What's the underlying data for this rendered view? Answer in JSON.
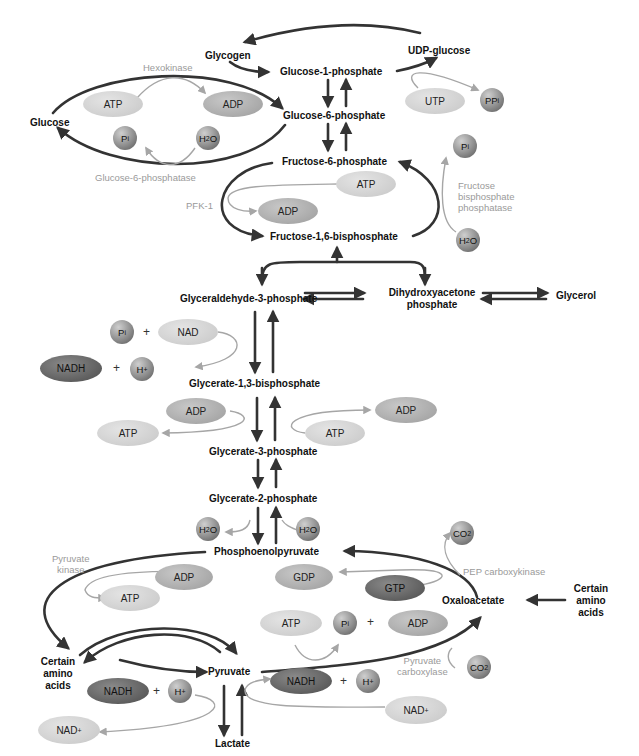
{
  "diagram": {
    "type": "metabolic-pathway",
    "title_fragment": "...p...g...",
    "colors": {
      "main_arrow": "#333333",
      "side_arrow": "#a6a6a6",
      "enzyme_text": "#9a9a9a",
      "node_text": "#111111"
    }
  },
  "nodes": {
    "glycogen": "Glycogen",
    "udp_glucose": "UDP-glucose",
    "glucose_1_phosphate": "Glucose-1-phosphate",
    "glucose": "Glucose",
    "glucose_6_phosphate": "Glucose-6-phosphate",
    "fructose_6_phosphate": "Fructose-6-phosphate",
    "fructose_1_6_bisphosphate": "Fructose-1,6-bisphosphate",
    "glyceraldehyde_3_phosphate": "Glyceraldehyde-3-phosphate",
    "dihydroxyacetone_phosphate_1": "Dihydroxyacetone",
    "dihydroxyacetone_phosphate_2": "phosphate",
    "glycerol": "Glycerol",
    "glycerate_1_3_bisphosphate": "Glycerate-1,3-bisphosphate",
    "glycerate_3_phosphate": "Glycerate-3-phosphate",
    "glycerate_2_phosphate": "Glycerate-2-phosphate",
    "phosphoenolpyruvate": "Phosphoenolpyruvate",
    "oxaloacetate": "Oxaloacetate",
    "amino_acids_right_1": "Certain",
    "amino_acids_right_2": "amino",
    "amino_acids_right_3": "acids",
    "amino_acids_left_1": "Certain",
    "amino_acids_left_2": "amino",
    "amino_acids_left_3": "acids",
    "pyruvate": "Pyruvate",
    "lactate": "Lactate"
  },
  "enzymes": {
    "hexokinase": "Hexokinase",
    "glucose_6_phosphatase": "Glucose-6-phosphatase",
    "pfk1": "PFK-1",
    "fbpase_1": "Fructose",
    "fbpase_2": "bisphosphate",
    "fbpase_3": "phosphatase",
    "pyruvate_kinase_1": "Pyruvate",
    "pyruvate_kinase_2": "kinase",
    "pep_carboxykinase": "PEP carboxykinase",
    "pyruvate_carboxylase_1": "Pyruvate",
    "pyruvate_carboxylase_2": "carboxylase"
  },
  "cofactors": {
    "atp": "ATP",
    "adp": "ADP",
    "utp": "UTP",
    "gtp": "GTP",
    "gdp": "GDP",
    "nad": "NAD",
    "nadh": "NADH",
    "nad_plus": "NAD",
    "p": "P",
    "i": "i",
    "pp": "PP",
    "h2o_h": "H",
    "h2o_2": "2",
    "h2o_o": "O",
    "co2_c": "CO",
    "co2_2": "2",
    "h": "H",
    "plus_sign": "+",
    "plus_charge": "+"
  }
}
